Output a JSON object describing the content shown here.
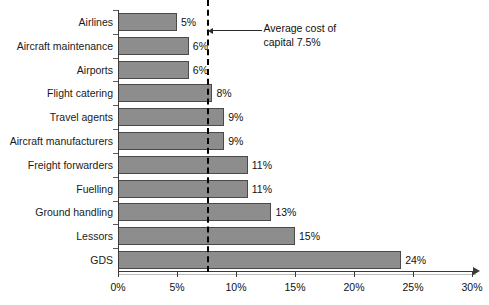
{
  "chart_data": {
    "type": "bar",
    "orientation": "horizontal",
    "title": "",
    "xlabel": "",
    "ylabel": "",
    "xlim": [
      0,
      30
    ],
    "grid": false,
    "legend": null,
    "categories": [
      "Airlines",
      "Aircraft maintenance",
      "Airports",
      "Flight catering",
      "Travel agents",
      "Aircraft manufacturers",
      "Freight forwarders",
      "Fuelling",
      "Ground handling",
      "Lessors",
      "GDS"
    ],
    "values": [
      5,
      6,
      6,
      8,
      9,
      9,
      11,
      11,
      13,
      15,
      24
    ],
    "value_labels": [
      "5%",
      "6%",
      "6%",
      "8%",
      "9%",
      "9%",
      "11%",
      "11%",
      "13%",
      "15%",
      "24%"
    ],
    "xticks": [
      0,
      5,
      10,
      15,
      20,
      25,
      30
    ],
    "xtick_labels": [
      "0%",
      "5%",
      "10%",
      "15%",
      "20%",
      "25%",
      "30%"
    ],
    "reference_line": {
      "value": 7.5,
      "label": "Average cost of\ncapital 7.5%",
      "style": "dashed"
    },
    "colors": {
      "bar_fill": "#8d8d8d",
      "bar_border": "#4a4a4a",
      "axis": "#3a3a3a",
      "reference_line": "#000000",
      "text": "#111111",
      "background": "#ffffff"
    }
  }
}
